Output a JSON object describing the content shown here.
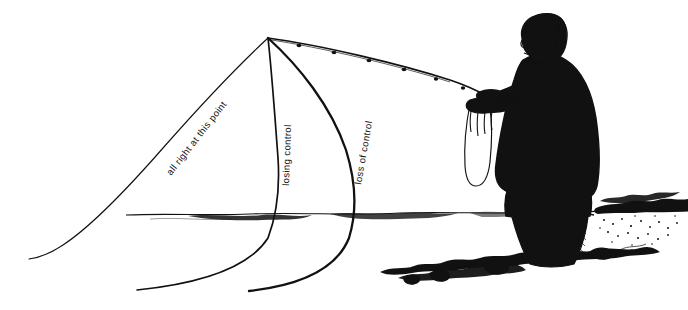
{
  "illustration": {
    "title": "Fly casting line control diagram",
    "medium": "pen-and-ink line drawing",
    "background_color": "#ffffff",
    "ink_color": "#111111",
    "labels": [
      {
        "id": "all-right",
        "text": "all right at this point",
        "rotation_deg": -52,
        "x": 171,
        "y": 176
      },
      {
        "id": "losing-control",
        "text": "losing control",
        "rotation_deg": -88,
        "x": 289,
        "y": 186
      },
      {
        "id": "loss-of-control",
        "text": "loss of control",
        "rotation_deg": -80,
        "x": 361,
        "y": 185
      }
    ],
    "curves": [
      {
        "id": "curve-all-right",
        "label": "all right at this point",
        "weight": "thin",
        "path": "M 268,38 C 230,70 150,150 98,200 C 68,230 44,250 29,259"
      },
      {
        "id": "curve-losing-control",
        "label": "losing control",
        "weight": "medium",
        "path": "M 268,38 C 272,80 276,150 280,200 C 258,250 200,278 137,289"
      },
      {
        "id": "curve-loss-of-control",
        "label": "loss of control",
        "weight": "thick",
        "path": "M 268,38 C 300,70 340,130 352,190 C 340,245 300,278 248,290"
      }
    ],
    "rod": {
      "id": "fishing-rod",
      "tip_point": {
        "x": 268,
        "y": 38
      },
      "grip_point": {
        "x": 487,
        "y": 96
      },
      "guide_count": 6,
      "guides": [
        {
          "x": 298,
          "y": 45
        },
        {
          "x": 333,
          "y": 52
        },
        {
          "x": 368,
          "y": 60
        },
        {
          "x": 403,
          "y": 69
        },
        {
          "x": 435,
          "y": 78
        },
        {
          "x": 462,
          "y": 87
        }
      ]
    },
    "figure": {
      "id": "fly-fisherman",
      "description": "man in profile facing left, wearing jacket and chest waders, holding fly rod with both hands",
      "hanging_line": {
        "description": "loop of slack fly line hanging from the line hand"
      }
    },
    "water": {
      "id": "water-surface",
      "surface_line_y": 214,
      "left_x": 125,
      "right_x": 688
    },
    "shore": {
      "id": "rocky-shore",
      "description": "rocks, gravel and stipple texture along the near bank"
    }
  }
}
